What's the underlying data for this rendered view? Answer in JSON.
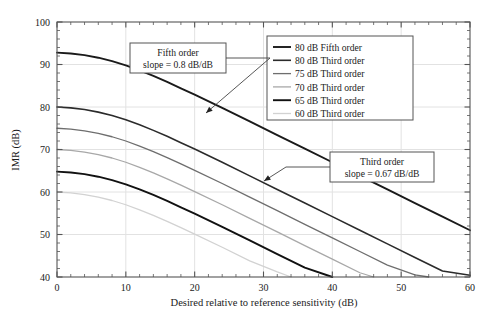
{
  "chart_data": {
    "type": "line",
    "title": "",
    "xlabel": "Desired relative to reference sensitivity (dB)",
    "ylabel": "IMR (dB)",
    "xlim": [
      0,
      60
    ],
    "ylim": [
      40,
      100
    ],
    "xticks": [
      0,
      10,
      20,
      30,
      40,
      50,
      60
    ],
    "yticks": [
      40,
      50,
      60,
      70,
      80,
      90,
      100
    ],
    "xtick_labels": [
      "0",
      "10",
      "20",
      "30",
      "40",
      "50",
      "60"
    ],
    "ytick_labels": [
      "40",
      "50",
      "60",
      "70",
      "80",
      "90",
      "100"
    ],
    "x_minor_step": 2,
    "y_minor_step": 2,
    "grid": true,
    "legend_position": "top-right",
    "series": [
      {
        "name": "80 dB Fifth order",
        "color": "#1a1a1a",
        "width": 1.9,
        "points": [
          [
            0,
            92.8
          ],
          [
            2,
            92.6
          ],
          [
            4,
            92.2
          ],
          [
            6,
            91.6
          ],
          [
            8,
            90.8
          ],
          [
            10,
            89.8
          ],
          [
            12,
            88.6
          ],
          [
            14,
            87.3
          ],
          [
            16,
            85.9
          ],
          [
            18,
            84.4
          ],
          [
            20,
            82.9
          ],
          [
            24,
            79.8
          ],
          [
            28,
            76.6
          ],
          [
            32,
            73.4
          ],
          [
            36,
            70.2
          ],
          [
            40,
            67.0
          ],
          [
            44,
            63.8
          ],
          [
            48,
            60.6
          ],
          [
            52,
            57.4
          ],
          [
            56,
            54.2
          ],
          [
            60,
            51.0
          ]
        ]
      },
      {
        "name": "80 dB Third order",
        "color": "#2b2b2b",
        "width": 1.6,
        "points": [
          [
            0,
            80.0
          ],
          [
            2,
            79.8
          ],
          [
            4,
            79.4
          ],
          [
            6,
            78.8
          ],
          [
            8,
            78.0
          ],
          [
            10,
            77.0
          ],
          [
            12,
            75.8
          ],
          [
            14,
            74.5
          ],
          [
            16,
            73.1
          ],
          [
            18,
            71.6
          ],
          [
            20,
            70.1
          ],
          [
            24,
            67.0
          ],
          [
            28,
            63.8
          ],
          [
            32,
            60.6
          ],
          [
            36,
            57.4
          ],
          [
            40,
            54.2
          ],
          [
            44,
            51.0
          ],
          [
            48,
            47.8
          ],
          [
            52,
            44.6
          ],
          [
            56,
            41.4
          ],
          [
            60,
            40.4
          ]
        ]
      },
      {
        "name": "75 dB Third order",
        "color": "#6e6e6e",
        "width": 1.3,
        "points": [
          [
            0,
            75.0
          ],
          [
            2,
            74.8
          ],
          [
            4,
            74.4
          ],
          [
            6,
            73.8
          ],
          [
            8,
            73.0
          ],
          [
            10,
            72.0
          ],
          [
            12,
            70.8
          ],
          [
            14,
            69.5
          ],
          [
            16,
            68.1
          ],
          [
            18,
            66.6
          ],
          [
            20,
            65.1
          ],
          [
            24,
            62.0
          ],
          [
            28,
            58.8
          ],
          [
            32,
            55.6
          ],
          [
            36,
            52.4
          ],
          [
            40,
            49.2
          ],
          [
            44,
            46.0
          ],
          [
            48,
            42.8
          ],
          [
            52,
            40.5
          ],
          [
            54,
            40.0
          ]
        ]
      },
      {
        "name": "70 dB Third order",
        "color": "#a8a8a8",
        "width": 1.3,
        "points": [
          [
            0,
            70.0
          ],
          [
            2,
            69.8
          ],
          [
            4,
            69.4
          ],
          [
            6,
            68.8
          ],
          [
            8,
            68.0
          ],
          [
            10,
            67.0
          ],
          [
            12,
            65.8
          ],
          [
            14,
            64.5
          ],
          [
            16,
            63.1
          ],
          [
            18,
            61.6
          ],
          [
            20,
            60.1
          ],
          [
            24,
            57.0
          ],
          [
            28,
            53.8
          ],
          [
            32,
            50.6
          ],
          [
            36,
            47.4
          ],
          [
            40,
            44.2
          ],
          [
            44,
            41.0
          ],
          [
            46,
            40.0
          ]
        ]
      },
      {
        "name": "65 dB Third order",
        "color": "#111111",
        "width": 1.9,
        "points": [
          [
            0,
            64.8
          ],
          [
            2,
            64.6
          ],
          [
            4,
            64.2
          ],
          [
            6,
            63.6
          ],
          [
            8,
            62.8
          ],
          [
            10,
            61.8
          ],
          [
            12,
            60.6
          ],
          [
            14,
            59.3
          ],
          [
            16,
            57.9
          ],
          [
            18,
            56.4
          ],
          [
            20,
            54.9
          ],
          [
            24,
            51.8
          ],
          [
            28,
            48.6
          ],
          [
            32,
            45.4
          ],
          [
            36,
            42.2
          ],
          [
            40,
            40.0
          ]
        ]
      },
      {
        "name": "60 dB Third order",
        "color": "#d2d2d2",
        "width": 1.3,
        "points": [
          [
            0,
            60.0
          ],
          [
            2,
            59.8
          ],
          [
            4,
            59.4
          ],
          [
            6,
            58.8
          ],
          [
            8,
            58.0
          ],
          [
            10,
            57.0
          ],
          [
            12,
            55.8
          ],
          [
            14,
            54.5
          ],
          [
            16,
            53.1
          ],
          [
            18,
            51.6
          ],
          [
            20,
            50.1
          ],
          [
            24,
            47.0
          ],
          [
            28,
            43.8
          ],
          [
            32,
            41.2
          ],
          [
            34,
            40.0
          ]
        ]
      }
    ],
    "annotations": [
      {
        "id": "fifth-order",
        "line1": "Fifth order",
        "line2": "slope = 0.8 dB/dB",
        "box": {
          "x": 130,
          "y": 43,
          "w": 96,
          "h": 30
        },
        "target": [
          206,
          113
        ]
      },
      {
        "id": "third-order",
        "line1": "Third order",
        "line2": "slope = 0.67 dB/dB",
        "box": {
          "x": 330,
          "y": 152,
          "w": 104,
          "h": 30
        },
        "target": [
          264,
          181
        ]
      }
    ]
  },
  "legend": {
    "items": [
      "80 dB Fifth order",
      "80 dB Third order",
      "75 dB Third order",
      "70 dB Third order",
      "65 dB Third order",
      "60 dB Third order"
    ]
  },
  "colors": {
    "frame": "#555555",
    "grid": "#e2e2e2",
    "background": "#ffffff",
    "text": "#1a1a1a"
  }
}
